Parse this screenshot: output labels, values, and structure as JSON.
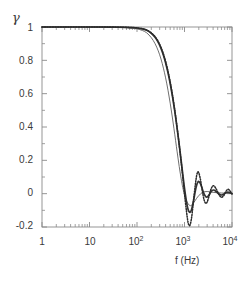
{
  "chart_data": {
    "type": "line",
    "title": "",
    "subtitle": "",
    "xlabel": "f (Hz)",
    "ylabel": "γ",
    "xscale": "log",
    "yscale": "linear",
    "xlim": [
      1,
      10000
    ],
    "ylim": [
      -0.2,
      1.0
    ],
    "grid": false,
    "legend": "none",
    "xtick_labels": [
      "1",
      "10",
      "10",
      "10",
      "10"
    ],
    "xtick_exponents": [
      "",
      "",
      "2",
      "3",
      "4"
    ],
    "xtick_values": [
      1,
      10,
      100,
      1000,
      10000
    ],
    "ytick_labels": [
      "1",
      "0.8",
      "0.6",
      "0.4",
      "0.2",
      "0",
      "-0.2"
    ],
    "ytick_values": [
      1,
      0.8,
      0.6,
      0.4,
      0.2,
      0,
      -0.2
    ],
    "series": [
      {
        "name": "thin-solid",
        "style": "solid-thin",
        "color": "#555555",
        "x": [
          1,
          3,
          10,
          20,
          40,
          60,
          80,
          100,
          130,
          160,
          200,
          240,
          280,
          320,
          360,
          400,
          450,
          500,
          550,
          600,
          650,
          700,
          750,
          800,
          850,
          900,
          1000,
          1100,
          1250,
          1400,
          1600,
          1800,
          2000,
          2400,
          3000,
          4000,
          6000,
          10000
        ],
        "y": [
          1.0,
          1.0,
          1.0,
          0.999,
          0.998,
          0.996,
          0.993,
          0.989,
          0.979,
          0.965,
          0.936,
          0.9,
          0.857,
          0.808,
          0.753,
          0.695,
          0.62,
          0.543,
          0.466,
          0.39,
          0.318,
          0.251,
          0.19,
          0.136,
          0.09,
          0.05,
          -0.008,
          -0.043,
          -0.068,
          -0.07,
          -0.05,
          -0.028,
          -0.012,
          0.008,
          0.013,
          0.008,
          0.004,
          0.002
        ]
      },
      {
        "name": "thick-solid",
        "style": "solid-thick",
        "color": "#333333",
        "x": [
          1,
          3,
          10,
          20,
          40,
          60,
          80,
          100,
          130,
          160,
          200,
          240,
          280,
          320,
          360,
          400,
          450,
          500,
          560,
          620,
          680,
          740,
          800,
          860,
          920,
          980,
          1040,
          1100,
          1160,
          1220,
          1300,
          1400,
          1500,
          1600,
          1700,
          1800,
          1900,
          2000,
          2150,
          2300,
          2450,
          2600,
          2800,
          3000,
          3250,
          3500,
          3800,
          4100,
          4500,
          5000,
          5500,
          6000,
          6700,
          7400,
          8200,
          9000,
          10000
        ],
        "y": [
          1.0,
          1.0,
          1.0,
          1.0,
          0.999,
          0.998,
          0.996,
          0.994,
          0.988,
          0.98,
          0.962,
          0.938,
          0.908,
          0.872,
          0.831,
          0.786,
          0.725,
          0.661,
          0.581,
          0.5,
          0.418,
          0.338,
          0.26,
          0.186,
          0.116,
          0.052,
          -0.003,
          -0.048,
          -0.082,
          -0.103,
          -0.112,
          -0.098,
          -0.062,
          -0.02,
          0.02,
          0.05,
          0.068,
          0.073,
          0.062,
          0.04,
          0.016,
          -0.003,
          -0.018,
          -0.02,
          -0.01,
          0.005,
          0.018,
          0.022,
          0.016,
          0.004,
          -0.005,
          -0.008,
          -0.003,
          0.005,
          0.009,
          0.006,
          0.001
        ]
      },
      {
        "name": "dotted",
        "style": "dotted",
        "color": "#2a2a2a",
        "x": [
          1,
          3,
          10,
          20,
          40,
          60,
          80,
          100,
          130,
          160,
          200,
          240,
          280,
          320,
          360,
          400,
          450,
          500,
          560,
          620,
          680,
          740,
          800,
          860,
          920,
          980,
          1040,
          1100,
          1160,
          1220,
          1300,
          1400,
          1500,
          1600,
          1700,
          1800,
          1900,
          2000,
          2150,
          2300,
          2450,
          2600,
          2800,
          3000,
          3250,
          3500,
          3800,
          4100,
          4500,
          5000,
          5500,
          6000,
          6700,
          7400,
          8200,
          9000,
          10000
        ],
        "y": [
          1.0,
          1.0,
          1.0,
          1.0,
          0.999,
          0.998,
          0.997,
          0.995,
          0.99,
          0.982,
          0.965,
          0.942,
          0.913,
          0.878,
          0.838,
          0.794,
          0.734,
          0.67,
          0.59,
          0.508,
          0.424,
          0.34,
          0.258,
          0.178,
          0.1,
          0.025,
          -0.045,
          -0.105,
          -0.155,
          -0.185,
          -0.19,
          -0.15,
          -0.08,
          -0.005,
          0.06,
          0.108,
          0.13,
          0.125,
          0.09,
          0.04,
          -0.005,
          -0.04,
          -0.058,
          -0.05,
          -0.02,
          0.015,
          0.04,
          0.048,
          0.035,
          0.01,
          -0.012,
          -0.022,
          -0.012,
          0.012,
          0.026,
          0.018,
          -0.002
        ]
      }
    ]
  },
  "axes": {
    "frame_color": "#8a8a8a",
    "tick_color": "#8a8a8a"
  }
}
